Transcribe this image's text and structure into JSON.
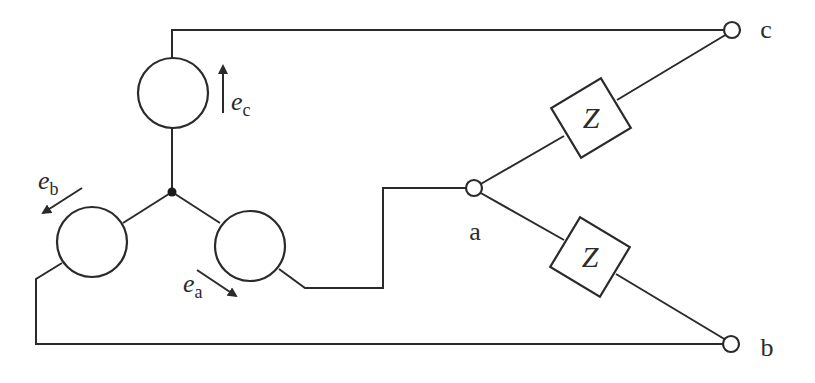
{
  "diagram": {
    "type": "three-phase circuit (star-connected sources, two impedances)",
    "sources": [
      {
        "id": "a",
        "emf_symbol": "e",
        "emf_subscript": "a",
        "arrow_direction": "down-right"
      },
      {
        "id": "b",
        "emf_symbol": "e",
        "emf_subscript": "b",
        "arrow_direction": "down-left"
      },
      {
        "id": "c",
        "emf_symbol": "e",
        "emf_subscript": "c",
        "arrow_direction": "up"
      }
    ],
    "impedances": [
      {
        "label": "Z",
        "between": [
          "a",
          "c"
        ]
      },
      {
        "label": "Z",
        "between": [
          "a",
          "b"
        ]
      }
    ],
    "terminals": [
      {
        "label": "a"
      },
      {
        "label": "b"
      },
      {
        "label": "c"
      }
    ],
    "neutral": {
      "type": "junction-dot"
    },
    "colors": {
      "line": "#2a2a2a",
      "background": "#ffffff"
    }
  }
}
